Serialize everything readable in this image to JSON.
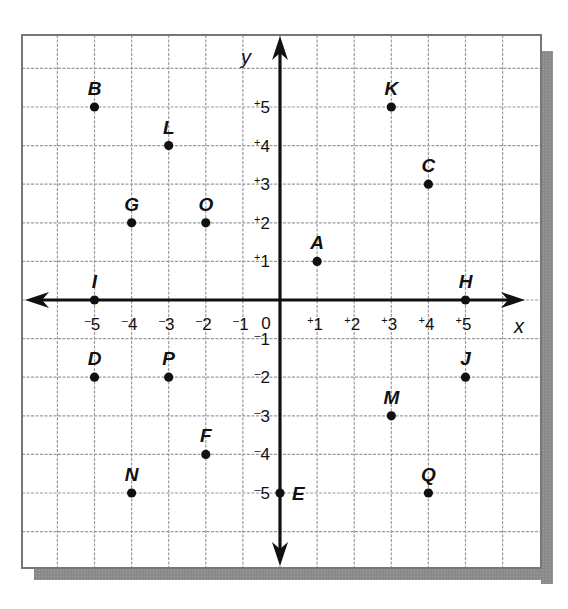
{
  "chart_data": {
    "type": "scatter",
    "title": "",
    "xlabel": "x",
    "ylabel": "y",
    "xlim": [
      -7,
      7
    ],
    "ylim": [
      -7,
      7
    ],
    "grid": true,
    "grid_style": "dashed",
    "x_ticks": [
      "-5",
      "-4",
      "-3",
      "-2",
      "-1",
      "0",
      "+1",
      "+2",
      "+3",
      "+4",
      "+5"
    ],
    "y_ticks": [
      "+5",
      "+4",
      "+3",
      "+2",
      "+1",
      "-1",
      "-2",
      "-3",
      "-4",
      "-5"
    ],
    "points": [
      {
        "label": "A",
        "x": 1,
        "y": 1
      },
      {
        "label": "B",
        "x": -5,
        "y": 5
      },
      {
        "label": "C",
        "x": 4,
        "y": 3
      },
      {
        "label": "D",
        "x": -5,
        "y": -2
      },
      {
        "label": "E",
        "x": 0,
        "y": -5
      },
      {
        "label": "F",
        "x": -2,
        "y": -4
      },
      {
        "label": "G",
        "x": -4,
        "y": 2
      },
      {
        "label": "H",
        "x": 5,
        "y": 0
      },
      {
        "label": "I",
        "x": -5,
        "y": 0
      },
      {
        "label": "J",
        "x": 5,
        "y": -2
      },
      {
        "label": "K",
        "x": 3,
        "y": 5
      },
      {
        "label": "L",
        "x": -3,
        "y": 4
      },
      {
        "label": "M",
        "x": 3,
        "y": -3
      },
      {
        "label": "N",
        "x": -4,
        "y": -5
      },
      {
        "label": "O",
        "x": -2,
        "y": 2
      },
      {
        "label": "P",
        "x": -3,
        "y": -2
      },
      {
        "label": "Q",
        "x": 4,
        "y": -5
      }
    ]
  },
  "axes": {
    "x_name": "x",
    "y_name": "y",
    "origin_label": "0"
  },
  "colors": {
    "grid": "#9a9a9a",
    "border": "#777777",
    "axis": "#111111",
    "shadow": "#8c8c8c",
    "point": "#111111"
  }
}
